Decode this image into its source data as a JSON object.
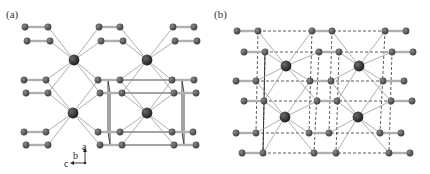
{
  "figure": {
    "panels": [
      {
        "label": "(a)",
        "axes": {
          "a": "a",
          "b": "b",
          "c": "c"
        },
        "rows_y": [
          27,
          41,
          80,
          93,
          132,
          145
        ],
        "row_atoms_x": [
          [
            25,
            48,
            99,
            120,
            173,
            194
          ],
          [
            27,
            50,
            101,
            123,
            175,
            197
          ],
          [
            24,
            46,
            98,
            120,
            172,
            194
          ],
          [
            26,
            48,
            100,
            122,
            174,
            196
          ],
          [
            24,
            46,
            98,
            120,
            172,
            193
          ],
          [
            26,
            48,
            100,
            122,
            174,
            196
          ]
        ],
        "big_atoms": [
          [
            74,
            60
          ],
          [
            147,
            60
          ],
          [
            73,
            113
          ],
          [
            147,
            113
          ]
        ]
      },
      {
        "label": "(b)",
        "rows_y": [
          31,
          52,
          81,
          101,
          133,
          153
        ],
        "row_atoms_x": [
          [
            237,
            258,
            312,
            332,
            385,
            406
          ],
          [
            244,
            265,
            319,
            339,
            392,
            413
          ],
          [
            236,
            256,
            310,
            331,
            383,
            404
          ],
          [
            244,
            264,
            317,
            337,
            391,
            412
          ],
          [
            236,
            256,
            309,
            329,
            380,
            401
          ],
          [
            242,
            263,
            314,
            336,
            389,
            410
          ]
        ],
        "big_atoms": [
          [
            286,
            66
          ],
          [
            359,
            66
          ],
          [
            285,
            117
          ],
          [
            358,
            117
          ]
        ]
      }
    ],
    "colors": {
      "small_atom": "#3a3a3a",
      "big_atom": "#1a1a1a",
      "bond": "#9a9a9a",
      "cell": "#333333"
    }
  }
}
